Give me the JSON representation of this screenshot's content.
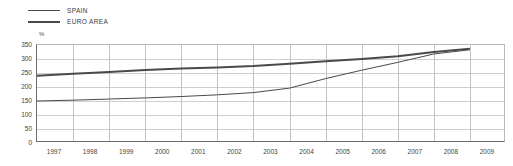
{
  "chart_data": {
    "type": "line",
    "title": "",
    "subtitle": "",
    "xlabel": "",
    "ylabel": "",
    "unit_label": "%",
    "grid": true,
    "legend_position": "top-left",
    "x": [
      1997,
      1998,
      1999,
      2000,
      2001,
      2002,
      2003,
      2004,
      2005,
      2006,
      2007,
      2008,
      2009
    ],
    "categories": [
      "1997",
      "1998",
      "1999",
      "2000",
      "2001",
      "2002",
      "2003",
      "2004",
      "2005",
      "2006",
      "2007",
      "2008",
      "2009"
    ],
    "xlim": [
      1997,
      2009
    ],
    "ylim": [
      0,
      350
    ],
    "yticks": [
      0,
      50,
      100,
      150,
      200,
      250,
      300,
      350
    ],
    "xticks": [
      "1997",
      "1998",
      "1999",
      "2000",
      "2001",
      "2002",
      "2003",
      "2004",
      "2005",
      "2006",
      "2007",
      "2008",
      "2009"
    ],
    "series": [
      {
        "name": "SPAIN",
        "color": "#4a4a4a",
        "line_width": 1,
        "values": [
          150,
          153,
          157,
          161,
          166,
          172,
          180,
          196,
          230,
          260,
          288,
          318,
          333
        ]
      },
      {
        "name": "EURO AREA",
        "color": "#4a4a4a",
        "line_width": 2,
        "values": [
          240,
          247,
          254,
          261,
          266,
          270,
          275,
          283,
          292,
          300,
          310,
          325,
          337
        ]
      }
    ]
  },
  "legend": {
    "items": [
      {
        "label": "SPAIN",
        "style": "thin"
      },
      {
        "label": "EURO AREA",
        "style": "thick"
      }
    ]
  },
  "axes": {
    "y_tick_labels": [
      "350",
      "300",
      "250",
      "200",
      "150",
      "100",
      "50",
      "0"
    ],
    "x_tick_labels": [
      "1997",
      "1998",
      "1999",
      "2000",
      "2001",
      "2002",
      "2003",
      "2004",
      "2005",
      "2006",
      "2007",
      "2008",
      "2009"
    ],
    "unit": "%"
  },
  "colors": {
    "series_line": "#4a4a4a",
    "gridline": "#cfcfcf",
    "vertical_gridline": "#c4c4c4",
    "axis": "#6d6d6d",
    "frame": "#b9b9b9",
    "text": "#3f3f3f",
    "background": "#ffffff"
  }
}
